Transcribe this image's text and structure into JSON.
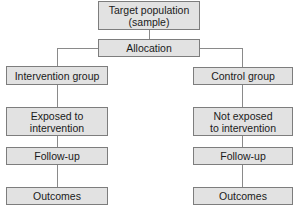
{
  "diagram": {
    "root": {
      "label": "Target population\n(sample)"
    },
    "allocation": {
      "label": "Allocation"
    },
    "left_branch": {
      "group": "Intervention group",
      "exposure": "Exposed to\nintervention",
      "follow_up": "Follow-up",
      "outcomes": "Outcomes"
    },
    "right_branch": {
      "group": "Control group",
      "exposure": "Not exposed\nto intervention",
      "follow_up": "Follow-up",
      "outcomes": "Outcomes"
    },
    "colors": {
      "box_fill": "#e2e2e2",
      "box_border": "#7d7d7d",
      "connector": "#8a8a8a"
    }
  }
}
